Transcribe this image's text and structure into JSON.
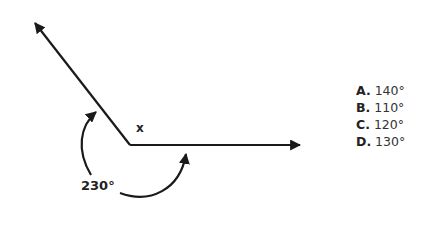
{
  "diagram": {
    "unknown_angle_label": "x",
    "reflex_angle_label": "230°",
    "colors": {
      "stroke": "#1a1a1a",
      "text": "#222222"
    }
  },
  "options": [
    {
      "letter": "A.",
      "value": "140°"
    },
    {
      "letter": "B.",
      "value": "110°"
    },
    {
      "letter": "C.",
      "value": "120°"
    },
    {
      "letter": "D.",
      "value": "130°"
    }
  ]
}
